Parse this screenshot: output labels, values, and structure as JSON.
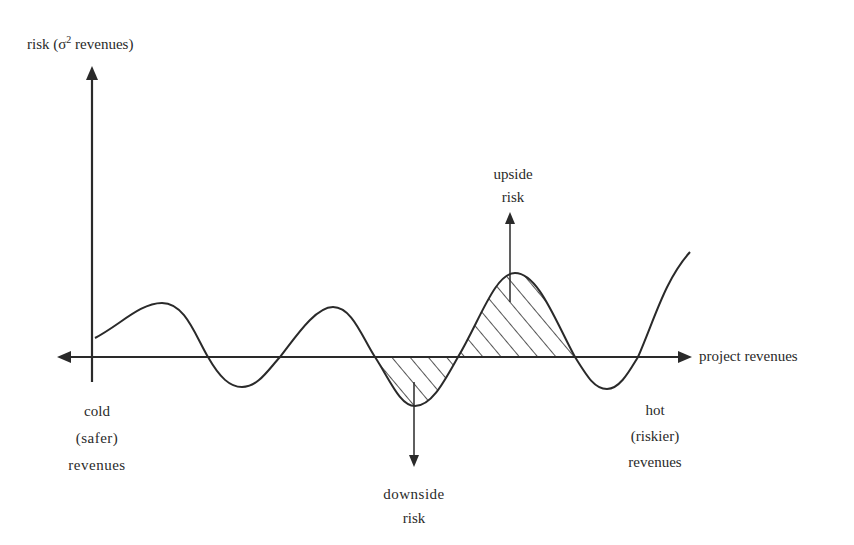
{
  "diagram": {
    "y_axis": {
      "label_prefix": "risk (σ",
      "label_sup": "2",
      "label_suffix": " revenues)"
    },
    "x_axis": {
      "label": "project revenues"
    },
    "annotations": {
      "upside": {
        "line1": "upside",
        "line2": "risk"
      },
      "downside": {
        "line1": "downside",
        "line2": "risk"
      },
      "cold": {
        "line1": "cold",
        "line2": "(safer)",
        "line3": "revenues"
      },
      "hot": {
        "line1": "hot",
        "line2": "(riskier)",
        "line3": "revenues"
      }
    },
    "colors": {
      "ink": "#2a2a2a",
      "background": "#ffffff"
    }
  }
}
